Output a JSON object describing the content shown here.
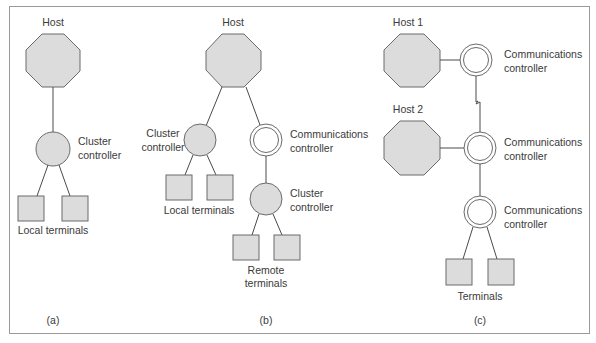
{
  "figure": {
    "panels": [
      {
        "id": "a",
        "caption": "(a)",
        "host_label": "Host",
        "cluster_label_1": "Cluster",
        "cluster_label_2": "controller",
        "terminals_label": "Local terminals"
      },
      {
        "id": "b",
        "caption": "(b)",
        "host_label": "Host",
        "cluster_label_1": "Cluster",
        "cluster_label_2": "controller",
        "local_terminals_label": "Local terminals",
        "comm_label_1": "Communications",
        "comm_label_2": "controller",
        "remote_cluster_label_1": "Cluster",
        "remote_cluster_label_2": "controller",
        "remote_terminals_label_1": "Remote",
        "remote_terminals_label_2": "terminals"
      },
      {
        "id": "c",
        "caption": "(c)",
        "host1_label": "Host 1",
        "host2_label": "Host 2",
        "comm1_label_1": "Communications",
        "comm1_label_2": "controller",
        "comm2_label_1": "Communications",
        "comm2_label_2": "controller",
        "comm3_label_1": "Communications",
        "comm3_label_2": "controller",
        "terminals_label": "Terminals"
      }
    ],
    "legend_semantics": {
      "octagon": "host",
      "filled-circle": "cluster-controller",
      "double-ring": "communications-controller",
      "square": "terminal",
      "zigzag-line": "remote-link"
    },
    "colors": {
      "shape_fill": "#dcdcdc",
      "stroke": "#6a6a6a",
      "text": "#3a3a3a",
      "frame": "#9a9a9a"
    }
  }
}
